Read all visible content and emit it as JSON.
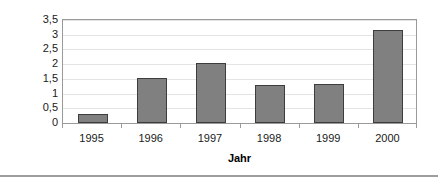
{
  "chart_data": {
    "type": "bar",
    "title": "",
    "subtitle": "",
    "xlabel": "Jahr",
    "ylabel": "PIPEs in Mrd. US$",
    "categories": [
      "1995",
      "1996",
      "1997",
      "1998",
      "1999",
      "2000"
    ],
    "values": [
      0.29,
      1.52,
      2.03,
      1.28,
      1.32,
      3.15
    ],
    "series": [
      {
        "name": "PIPEs",
        "values": [
          0.29,
          1.52,
          2.03,
          1.28,
          1.32,
          3.15
        ]
      }
    ],
    "ylim": [
      0,
      3.5
    ],
    "ytick_values": [
      0,
      0.5,
      1,
      1.5,
      2,
      2.5,
      3,
      3.5
    ],
    "ytick_labels": [
      "0",
      "0,5",
      "1",
      "1,5",
      "2",
      "2,5",
      "3",
      "3,5"
    ],
    "grid": true,
    "grid_axis": "y",
    "legend": false,
    "legend_position": "none",
    "decimal_separator": ",",
    "bar_color": "#808080",
    "bar_border_color": "#3d3d3d",
    "gridline_color": "#e4e4e4",
    "frame_color": "#9a9a9a",
    "background_color": "#ffffff",
    "text_color": "#1a1a1a"
  },
  "axes": {
    "y_title": "PIPEs in Mrd. US$",
    "x_title": "Jahr"
  }
}
